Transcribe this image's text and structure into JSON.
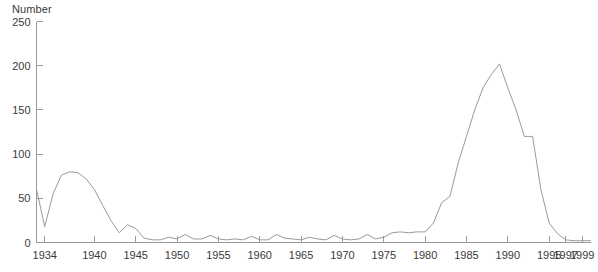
{
  "chart_data": {
    "type": "line",
    "title": "",
    "xlabel": "",
    "ylabel": "Number",
    "ylim": [
      0,
      250
    ],
    "xlim": [
      1933,
      2000
    ],
    "yticks": [
      0,
      50,
      100,
      150,
      200,
      250
    ],
    "xticks": [
      1934,
      1940,
      1945,
      1950,
      1955,
      1960,
      1965,
      1970,
      1975,
      1980,
      1985,
      1990,
      1995,
      1997,
      1999
    ],
    "grid": false,
    "legend": null,
    "line_color": "#9a9a9a",
    "axis_color": "#9a9a9a",
    "text_color": "#3a3a3a",
    "background": "#ffffff",
    "series": [
      {
        "name": "Number",
        "x": [
          1933,
          1934,
          1935,
          1936,
          1937,
          1938,
          1939,
          1940,
          1941,
          1942,
          1943,
          1944,
          1945,
          1946,
          1947,
          1948,
          1949,
          1950,
          1951,
          1952,
          1953,
          1954,
          1955,
          1956,
          1957,
          1958,
          1959,
          1960,
          1961,
          1962,
          1963,
          1964,
          1965,
          1966,
          1967,
          1968,
          1969,
          1970,
          1971,
          1972,
          1973,
          1974,
          1975,
          1976,
          1977,
          1978,
          1979,
          1980,
          1981,
          1982,
          1983,
          1984,
          1985,
          1986,
          1987,
          1988,
          1989,
          1990,
          1991,
          1992,
          1993,
          1994,
          1995,
          1996,
          1997,
          1998,
          1999,
          2000
        ],
        "values": [
          60,
          18,
          55,
          76,
          80,
          79,
          72,
          60,
          42,
          25,
          11,
          20,
          16,
          5,
          3,
          3,
          6,
          4,
          9,
          4,
          4,
          8,
          4,
          3,
          4,
          3,
          7,
          3,
          3,
          9,
          5,
          4,
          3,
          6,
          4,
          3,
          8,
          4,
          3,
          4,
          9,
          4,
          6,
          11,
          12,
          11,
          12,
          12,
          22,
          45,
          52,
          90,
          120,
          150,
          175,
          190,
          202,
          175,
          150,
          120,
          120,
          60,
          22,
          10,
          3,
          2,
          2,
          2
        ]
      }
    ]
  }
}
